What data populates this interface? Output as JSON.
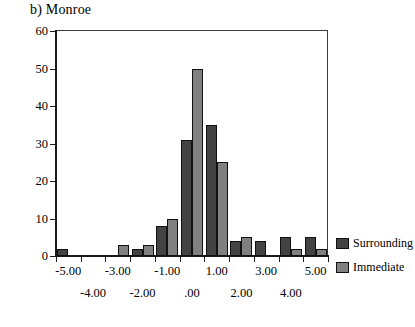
{
  "chart_data": {
    "type": "bar",
    "title": "b) Monroe",
    "xlabel": "",
    "ylabel": "",
    "ylim": [
      0,
      60
    ],
    "ytick_labels": [
      "0",
      "10",
      "20",
      "30",
      "40",
      "50",
      "60"
    ],
    "yticks": [
      0,
      10,
      20,
      30,
      40,
      50,
      60
    ],
    "grid": false,
    "legend_position": "right",
    "categories": [
      "-5.00",
      "-4.00",
      "-3.00",
      "-2.00",
      "-1.00",
      ".00",
      "1.00",
      "2.00",
      "3.00",
      "4.00",
      "5.00"
    ],
    "xtick_labels_row_a": [
      "-5.00",
      "-2.00",
      ".00",
      "2.00",
      "4.00"
    ],
    "xtick_labels_row_b": [
      "-4.00",
      "-1.00",
      "1.00",
      "3.00",
      "5.00"
    ],
    "series": [
      {
        "name": "Surrounding",
        "color": "#434343",
        "values": [
          2,
          0,
          0,
          2,
          8,
          31,
          35,
          4,
          4,
          5,
          5
        ]
      },
      {
        "name": "Immediate",
        "color": "#808080",
        "values": [
          0,
          0,
          3,
          3,
          10,
          50,
          25,
          5,
          0,
          2,
          2
        ]
      }
    ]
  },
  "legend": {
    "items": [
      {
        "label": "Surrounding",
        "swatch": "dark"
      },
      {
        "label": "Immediate",
        "swatch": "light"
      }
    ]
  },
  "axis": {
    "y_labels": [
      "60",
      "50",
      "40",
      "30",
      "20",
      "10",
      "0"
    ],
    "x_labels_top": [
      "-5.00",
      "-2.00",
      ".00",
      "2.00",
      "4.00"
    ],
    "x_labels_bottom": [
      "-4.00",
      "-1.00",
      "1.00",
      "3.00",
      "5.00"
    ]
  }
}
